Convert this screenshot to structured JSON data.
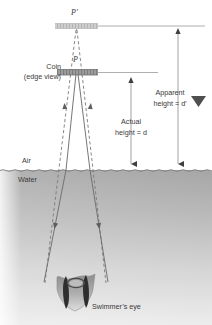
{
  "figure": {
    "labels": {
      "image_point": "P′",
      "object_point": "P",
      "coin_line1": "Coin",
      "coin_line2": "(edge view)",
      "actual_line1": "Actual",
      "actual_line2": "height = d",
      "apparent_line1": "Apparent",
      "apparent_line2": "height = d′",
      "air": "Air",
      "water": "Water",
      "eye": "Swimmer’s eye"
    },
    "colors": {
      "line": "#6b6b6b",
      "ray_solid": "#6f6f6f",
      "ray_dashed": "#7a7a7a",
      "coin_fill": "#9a9a9a",
      "image_fill": "#c9c9c9",
      "water_top": "#a9a9a9",
      "water_bottom": "#e8e8e8",
      "text": "#3a3a3a",
      "marker": "#4a4a4a"
    },
    "geometry": {
      "image_bar_y": 26,
      "coin_bar_y": 72,
      "water_surface_y": 170,
      "eye_center_x": 75,
      "eye_center_y": 292,
      "actual_arrow_x": 131,
      "apparent_arrow_x": 178,
      "apparent_top_y": 28,
      "actual_top_y": 77
    }
  }
}
